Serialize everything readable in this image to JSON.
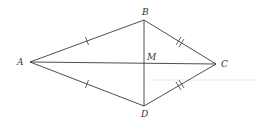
{
  "diagram": {
    "type": "kite with diagonals",
    "colors": {
      "line": "#3a3a3a",
      "label": "#333333",
      "background": "#ffffff"
    },
    "points": {
      "A": {
        "label": "A",
        "x": 30,
        "y": 62
      },
      "B": {
        "label": "B",
        "x": 144,
        "y": 20
      },
      "C": {
        "label": "C",
        "x": 216,
        "y": 64
      },
      "D": {
        "label": "D",
        "x": 144,
        "y": 106
      },
      "M": {
        "label": "M",
        "x": 144,
        "y": 63
      }
    },
    "segments": [
      {
        "from": "A",
        "to": "B",
        "ticks": 1
      },
      {
        "from": "A",
        "to": "D",
        "ticks": 1
      },
      {
        "from": "B",
        "to": "C",
        "ticks": 2
      },
      {
        "from": "D",
        "to": "C",
        "ticks": 2
      },
      {
        "from": "A",
        "to": "C",
        "ticks": 0
      },
      {
        "from": "B",
        "to": "D",
        "ticks": 0
      }
    ],
    "labels": {
      "A": "A",
      "B": "B",
      "C": "C",
      "D": "D",
      "M": "M"
    }
  }
}
